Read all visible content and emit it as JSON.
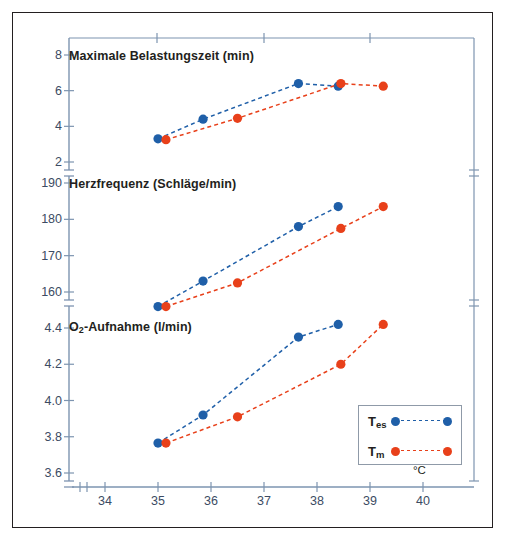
{
  "chart_data": {
    "type": "line",
    "title": "",
    "xlabel": "°C",
    "xlim": [
      33.4,
      40.8
    ],
    "xticks": [
      34,
      35,
      36,
      37,
      38,
      39,
      40
    ],
    "xtick_labels": [
      "34",
      "35",
      "36",
      "37",
      "38",
      "39",
      "40"
    ],
    "axis_break_x": true,
    "grid": false,
    "legend_position": "bottom-right",
    "legend": [
      {
        "name": "Tes",
        "key_main": "T",
        "key_sub": "es",
        "color": "#1f5fa8"
      },
      {
        "name": "Tm",
        "key_main": "T",
        "key_sub": "m",
        "color": "#e8401a"
      }
    ],
    "panels": [
      {
        "id": "belastungszeit",
        "title": "Maximale Belastungszeit (min)",
        "title_main": "Maximale Belastungszeit (min)",
        "title_sub": "",
        "title_tail": "",
        "ylabel": "min",
        "ylim": [
          1.6,
          8.9
        ],
        "yticks": [
          2,
          4,
          6,
          8
        ],
        "ytick_labels": [
          "2",
          "4",
          "6",
          "8"
        ],
        "series": [
          {
            "name": "Tes",
            "color": "#1f5fa8",
            "x": [
              35.0,
              35.85,
              37.65,
              38.4
            ],
            "values": [
              3.3,
              4.4,
              6.4,
              6.25
            ]
          },
          {
            "name": "Tm",
            "color": "#e8401a",
            "x": [
              35.15,
              36.5,
              38.45,
              39.25
            ],
            "values": [
              3.25,
              4.45,
              6.4,
              6.25
            ]
          }
        ]
      },
      {
        "id": "herzfrequenz",
        "title": "Herzfrequenz (Schläge/min)",
        "title_main": "Herzfrequenz (Schläge",
        "title_sub": "",
        "title_tail": "/min)",
        "ylabel": "Schläge/min",
        "ylim": [
          154.0,
          192.5
        ],
        "yticks": [
          160,
          170,
          180,
          190
        ],
        "ytick_labels": [
          "160",
          "170",
          "180",
          "190"
        ],
        "series": [
          {
            "name": "Tes",
            "color": "#1f5fa8",
            "x": [
              35.0,
              35.85,
              37.65,
              38.4
            ],
            "values": [
              156.0,
              163.0,
              178.0,
              183.5
            ]
          },
          {
            "name": "Tm",
            "color": "#e8401a",
            "x": [
              35.15,
              36.5,
              38.45,
              39.25
            ],
            "values": [
              156.0,
              162.5,
              177.5,
              183.5
            ]
          }
        ]
      },
      {
        "id": "o2-aufnahme",
        "title": "O2-Aufnahme (l/min)",
        "title_main": "O",
        "title_sub": "2",
        "title_tail": "-Aufnahme (l/min)",
        "ylabel": "l/min",
        "ylim": [
          3.52,
          4.52
        ],
        "yticks": [
          3.6,
          3.8,
          4.0,
          4.2,
          4.4
        ],
        "ytick_labels": [
          "3.6",
          "3.8",
          "4.0",
          "4.2",
          "4.4"
        ],
        "series": [
          {
            "name": "Tes",
            "color": "#1f5fa8",
            "x": [
              35.0,
              35.85,
              37.65,
              38.4
            ],
            "values": [
              3.765,
              3.92,
              4.35,
              4.42
            ]
          },
          {
            "name": "Tm",
            "color": "#e8401a",
            "x": [
              35.15,
              36.5,
              38.45,
              39.25
            ],
            "values": [
              3.765,
              3.91,
              4.2,
              4.42
            ]
          }
        ]
      }
    ],
    "colors": {
      "axis": "#7d94b0",
      "tick_text": "#3c4b63",
      "blue_series": "#1f5fa8",
      "red_series": "#e8401a",
      "frame": "#231f20",
      "legend_border": "#8f9aa8"
    }
  }
}
